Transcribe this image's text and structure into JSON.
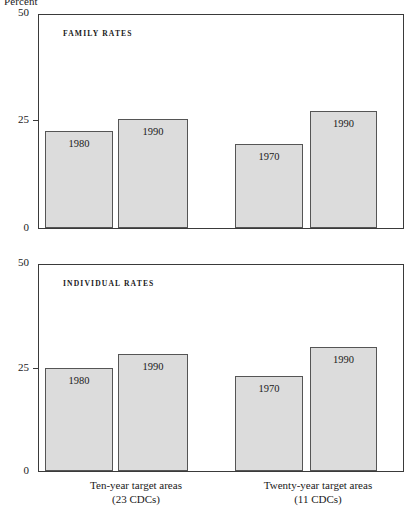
{
  "axis": {
    "unit_label": "Percent",
    "ticks": [
      "50",
      "25",
      "0"
    ],
    "ymin": 0,
    "ymax": 50
  },
  "panels": [
    {
      "title": "FAMILY RATES",
      "bars": [
        {
          "label": "1980",
          "value": 22.7
        },
        {
          "label": "1990",
          "value": 25.5
        },
        {
          "label": "1970",
          "value": 19.8
        },
        {
          "label": "1990",
          "value": 27.5
        }
      ]
    },
    {
      "title": "INDIVIDUAL RATES",
      "bars": [
        {
          "label": "1980",
          "value": 25.0
        },
        {
          "label": "1990",
          "value": 28.5
        },
        {
          "label": "1970",
          "value": 23.0
        },
        {
          "label": "1990",
          "value": 30.0
        }
      ]
    }
  ],
  "groups": [
    {
      "line1": "Ten-year target areas",
      "line2": "(23 CDCs)"
    },
    {
      "line1": "Twenty-year target areas",
      "line2": "(11 CDCs)"
    }
  ],
  "chart_data": {
    "type": "bar",
    "title": "",
    "xlabel": "",
    "ylabel": "Percent",
    "ylim": [
      0,
      50
    ],
    "yticks": [
      0,
      25,
      50
    ],
    "grid": false,
    "legend": "none",
    "panels": [
      {
        "name": "FAMILY RATES",
        "categories": [
          "Ten-year target areas (23 CDCs)",
          "Twenty-year target areas (11 CDCs)"
        ],
        "series": [
          {
            "name": "earlier year",
            "point_labels": [
              "1980",
              "1970"
            ],
            "values": [
              22.7,
              19.8
            ]
          },
          {
            "name": "1990",
            "point_labels": [
              "1990",
              "1990"
            ],
            "values": [
              25.5,
              27.5
            ]
          }
        ]
      },
      {
        "name": "INDIVIDUAL RATES",
        "categories": [
          "Ten-year target areas (23 CDCs)",
          "Twenty-year target areas (11 CDCs)"
        ],
        "series": [
          {
            "name": "earlier year",
            "point_labels": [
              "1980",
              "1970"
            ],
            "values": [
              25.0,
              23.0
            ]
          },
          {
            "name": "1990",
            "point_labels": [
              "1990",
              "1990"
            ],
            "values": [
              28.5,
              30.0
            ]
          }
        ]
      }
    ]
  }
}
